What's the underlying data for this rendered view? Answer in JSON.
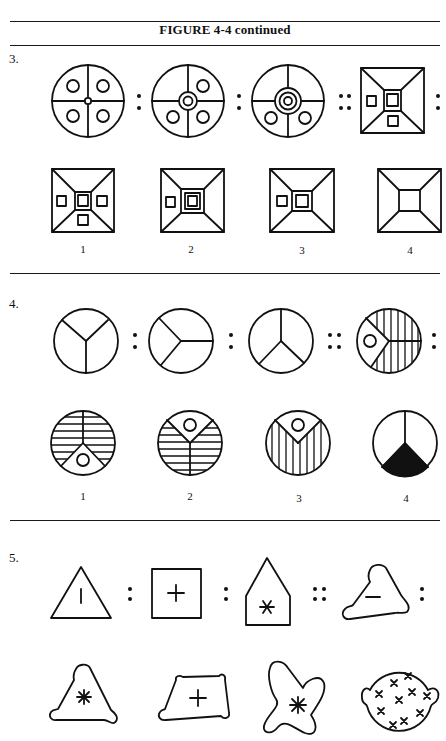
{
  "header": {
    "title": "FIGURE 4-4 continued"
  },
  "problems": [
    {
      "number": "3.",
      "stimulus": [
        "circle quadrants with four small circles and tiny center ring",
        "circle quadrants with three small circles and double center ring",
        "circle quadrants with two small circles and triple center ring",
        "square pyramid with three small squares and double center square"
      ],
      "separators": [
        ":",
        ":",
        "::",
        ":"
      ],
      "options": [
        {
          "label": "1",
          "desc": "square pyramid, four small squares, double center square"
        },
        {
          "label": "2",
          "desc": "square pyramid, one small square, triple center square"
        },
        {
          "label": "3",
          "desc": "square pyramid, one small square, double center square"
        },
        {
          "label": "4",
          "desc": "square pyramid, plain center square"
        }
      ]
    },
    {
      "number": "4.",
      "stimulus": [
        "circle divided in Y",
        "circle divided sideways Y",
        "circle divided inverted Y",
        "circle with sideways wedge containing circle, vertical hatching"
      ],
      "separators": [
        ":",
        ":",
        "::",
        ":"
      ],
      "options": [
        {
          "label": "1",
          "desc": "horizontal hatching, bottom wedge with circle"
        },
        {
          "label": "2",
          "desc": "horizontal hatching, top wedge with circle"
        },
        {
          "label": "3",
          "desc": "vertical hatching, top wedge with circle"
        },
        {
          "label": "4",
          "desc": "inverted Y with black bottom wedge"
        }
      ]
    },
    {
      "number": "5.",
      "stimulus": [
        "triangle with vertical bar",
        "square with plus",
        "pentagon house with asterisk",
        "rounded triangle with minus"
      ],
      "separators": [
        ":",
        ":",
        "::",
        ":"
      ],
      "options": [
        {
          "label": "",
          "desc": "rounded triangle with asterisk"
        },
        {
          "label": "",
          "desc": "rounded trapezoid with plus"
        },
        {
          "label": "",
          "desc": "blob with asterisk"
        },
        {
          "label": "",
          "desc": "round blob with many x marks"
        }
      ]
    }
  ],
  "colors": {
    "ink": "#111111",
    "paper": "#ffffff"
  }
}
